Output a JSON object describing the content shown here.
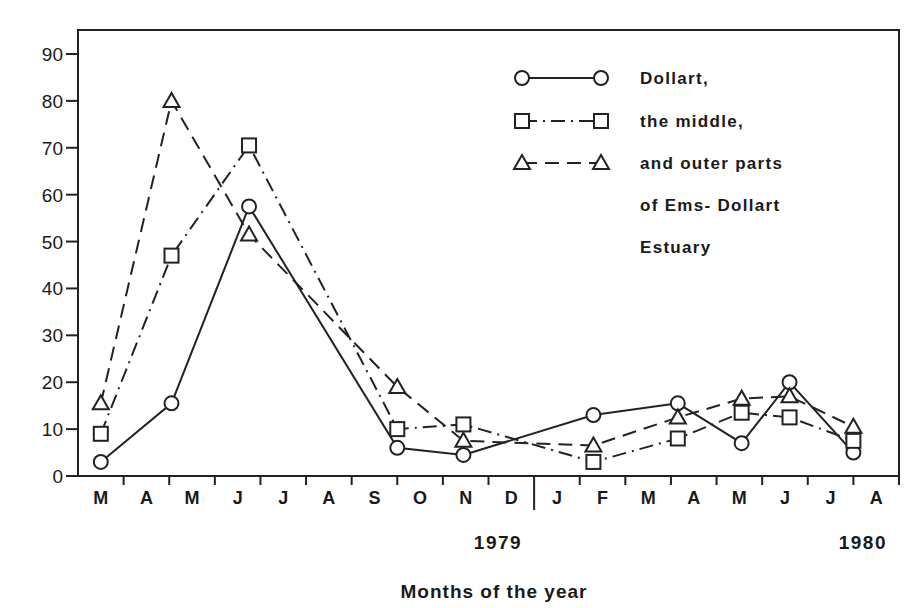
{
  "chart_data": {
    "type": "line",
    "title": "",
    "xlabel": "Months of the year",
    "ylabel": "",
    "ylim": [
      0,
      90
    ],
    "yticks": [
      0,
      10,
      20,
      30,
      40,
      50,
      60,
      70,
      80,
      90
    ],
    "grid": false,
    "legend_position": "upper right (inside)",
    "month_ticks": [
      "M",
      "A",
      "M",
      "J",
      "J",
      "A",
      "S",
      "O",
      "N",
      "D",
      "J",
      "F",
      "M",
      "A",
      "M",
      "J",
      "J",
      "A"
    ],
    "year_labels": [
      {
        "label": "1979",
        "after_month_index": 9
      },
      {
        "label": "1980",
        "after_month_index": 17
      }
    ],
    "x": [
      "Mar 1979",
      "May 1979",
      "Jul 1979",
      "Oct 1979",
      "Nov 1979",
      "Feb 1980",
      "Apr 1980",
      "Jun 1980",
      "Jul 1980",
      "Aug 1980"
    ],
    "x_month_index": [
      0.5,
      2.05,
      3.75,
      7.0,
      8.45,
      11.3,
      13.15,
      14.55,
      15.6,
      17.0
    ],
    "series": [
      {
        "name": "Dollart,",
        "marker": "circle",
        "line": "solid",
        "values": [
          3,
          15.5,
          57.5,
          6,
          4.5,
          13,
          15.5,
          7,
          20,
          5
        ]
      },
      {
        "name": "the middle,",
        "marker": "square",
        "line": "dash-dot",
        "values": [
          9,
          47,
          70.5,
          10,
          11,
          3,
          8,
          13.5,
          12.5,
          7.5
        ]
      },
      {
        "name": "and outer parts of Ems-Dollart Estuary",
        "marker": "triangle",
        "line": "dashed",
        "values": [
          15.5,
          80,
          51.5,
          19,
          7.5,
          6.5,
          12.5,
          16.5,
          17,
          10.5
        ]
      }
    ],
    "legend": {
      "lines": [
        "Dollart,",
        "the middle,",
        "and outer parts",
        "of Ems- Dollart",
        "Estuary"
      ]
    }
  }
}
